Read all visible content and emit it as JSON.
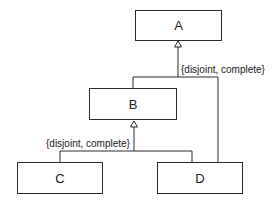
{
  "classes": {
    "a": "A",
    "b": "B",
    "c": "C",
    "d": "D"
  },
  "constraints": {
    "a_generalization": "{disjoint, complete}",
    "b_generalization": "{disjoint, complete}"
  }
}
